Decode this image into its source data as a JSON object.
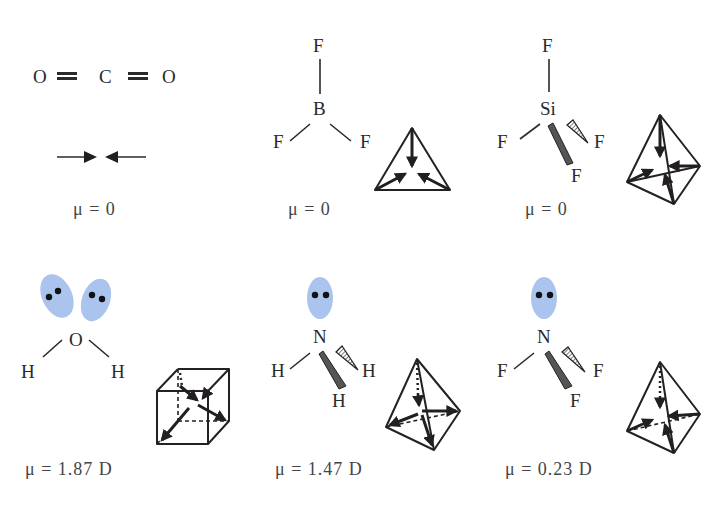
{
  "figure": {
    "molecules": [
      {
        "id": "co2",
        "formula": "CO2",
        "atoms": [
          "O",
          "C",
          "O"
        ],
        "bond_type": "double",
        "dipole_label": "μ = 0",
        "dipole_value": 0,
        "unit": ""
      },
      {
        "id": "bf3",
        "formula": "BF3",
        "central": "B",
        "ligands": [
          "F",
          "F",
          "F"
        ],
        "geometry": "trigonal planar",
        "dipole_label": "μ = 0",
        "dipole_value": 0,
        "unit": ""
      },
      {
        "id": "sif4",
        "formula": "SiF4",
        "central": "Si",
        "ligands": [
          "F",
          "F",
          "F",
          "F"
        ],
        "geometry": "tetrahedral",
        "dipole_label": "μ = 0",
        "dipole_value": 0,
        "unit": ""
      },
      {
        "id": "h2o",
        "formula": "H2O",
        "central": "O",
        "ligands": [
          "H",
          "H"
        ],
        "lone_pairs": 2,
        "geometry": "bent",
        "dipole_label": "μ = 1.87 D",
        "dipole_value": 1.87,
        "unit": "D"
      },
      {
        "id": "nh3",
        "formula": "NH3",
        "central": "N",
        "ligands": [
          "H",
          "H",
          "H"
        ],
        "lone_pairs": 1,
        "geometry": "trigonal pyramidal",
        "dipole_label": "μ = 1.47 D",
        "dipole_value": 1.47,
        "unit": "D"
      },
      {
        "id": "nf3",
        "formula": "NF3",
        "central": "N",
        "ligands": [
          "F",
          "F",
          "F"
        ],
        "lone_pairs": 1,
        "geometry": "trigonal pyramidal",
        "dipole_label": "μ = 0.23 D",
        "dipole_value": 0.23,
        "unit": "D"
      }
    ]
  },
  "labels": {
    "co2": {
      "o1": "O",
      "c": "C",
      "o2": "O",
      "mu": "μ = 0"
    },
    "bf3": {
      "f_top": "F",
      "b": "B",
      "f_left": "F",
      "f_right": "F",
      "mu": "μ = 0"
    },
    "sif4": {
      "f_top": "F",
      "si": "Si",
      "f_left": "F",
      "f_right": "F",
      "f_bottom": "F",
      "mu": "μ = 0"
    },
    "h2o": {
      "o": "O",
      "h_left": "H",
      "h_right": "H",
      "mu": "μ = 1.87 D"
    },
    "nh3": {
      "n": "N",
      "h_left": "H",
      "h_right": "H",
      "h_bottom": "H",
      "mu": "μ = 1.47 D"
    },
    "nf3": {
      "n": "N",
      "f_left": "F",
      "f_right": "F",
      "f_bottom": "F",
      "mu": "μ = 0.23 D"
    }
  },
  "colors": {
    "lone_pair": "#aac4ee",
    "ink": "#2a2a2a"
  }
}
